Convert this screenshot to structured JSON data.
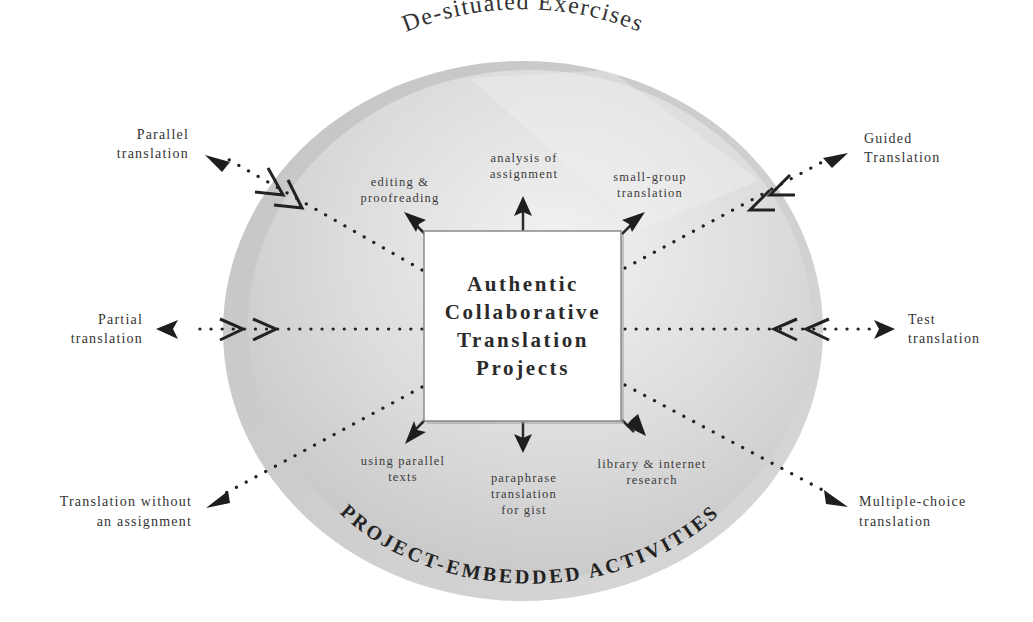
{
  "diagram": {
    "title_arc_top": "De-situated Exercises",
    "title_arc_bottom": "PROJECT-EMBEDDED ACTIVITIES",
    "center": {
      "lines": [
        "Authentic",
        "Collaborative",
        "Translation",
        "Projects"
      ]
    },
    "inner_activities": [
      {
        "id": "editing",
        "lines": [
          "editing &",
          "proofreading"
        ],
        "position": "top-left"
      },
      {
        "id": "analysis",
        "lines": [
          "analysis of",
          "assignment"
        ],
        "position": "top"
      },
      {
        "id": "small-group",
        "lines": [
          "small-group",
          "translation"
        ],
        "position": "top-right"
      },
      {
        "id": "parallel-texts",
        "lines": [
          "using parallel",
          "texts"
        ],
        "position": "bottom-left"
      },
      {
        "id": "paraphrase",
        "lines": [
          "paraphrase",
          "translation",
          "for gist"
        ],
        "position": "bottom"
      },
      {
        "id": "library",
        "lines": [
          "library & internet",
          "research"
        ],
        "position": "bottom-right"
      }
    ],
    "outer_exercises": [
      {
        "id": "parallel-translation",
        "lines": [
          "Parallel",
          "translation"
        ],
        "position": "top-left"
      },
      {
        "id": "partial-translation",
        "lines": [
          "Partial",
          "translation"
        ],
        "position": "left"
      },
      {
        "id": "translation-without-assignment",
        "lines": [
          "Translation without",
          "an assignment"
        ],
        "position": "bottom-left"
      },
      {
        "id": "guided-translation",
        "lines": [
          "Guided",
          "Translation"
        ],
        "position": "top-right"
      },
      {
        "id": "test-translation",
        "lines": [
          "Test",
          "translation"
        ],
        "position": "right"
      },
      {
        "id": "multiple-choice-translation",
        "lines": [
          "Multiple-choice",
          "translation"
        ],
        "position": "bottom-right"
      }
    ],
    "colors": {
      "circle_light": "#ececec",
      "circle_mid": "#d4d4d4",
      "circle_edge": "#bdbdbd",
      "box_fill": "#ffffff",
      "ink": "#222222"
    }
  }
}
